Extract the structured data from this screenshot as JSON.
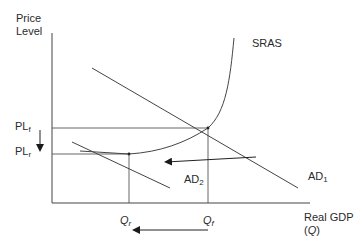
{
  "diagram": {
    "type": "economics-AS-AD",
    "y_axis_label_line1": "Price",
    "y_axis_label_line2": "Level",
    "x_axis_label_line1": "Real GDP",
    "x_axis_label_line2_open": "(",
    "x_axis_label_line2_var": "Q",
    "x_axis_label_line2_close": ")",
    "curves": {
      "sras": "SRAS",
      "ad1_base": "AD",
      "ad1_sub": "1",
      "ad2_base": "AD",
      "ad2_sub": "2"
    },
    "price_levels": {
      "plf_base": "PL",
      "plf_sub": "f",
      "plr_base": "PL",
      "plr_sub": "r"
    },
    "quantities": {
      "qr_base": "Q",
      "qr_sub": "r",
      "qf_base": "Q",
      "qf_sub": "f"
    },
    "arrows": {
      "price_level_shift": "down",
      "demand_shift": "left",
      "output_shift": "left"
    },
    "colors": {
      "line": "#3a3a3a",
      "background": "#ffffff"
    }
  }
}
